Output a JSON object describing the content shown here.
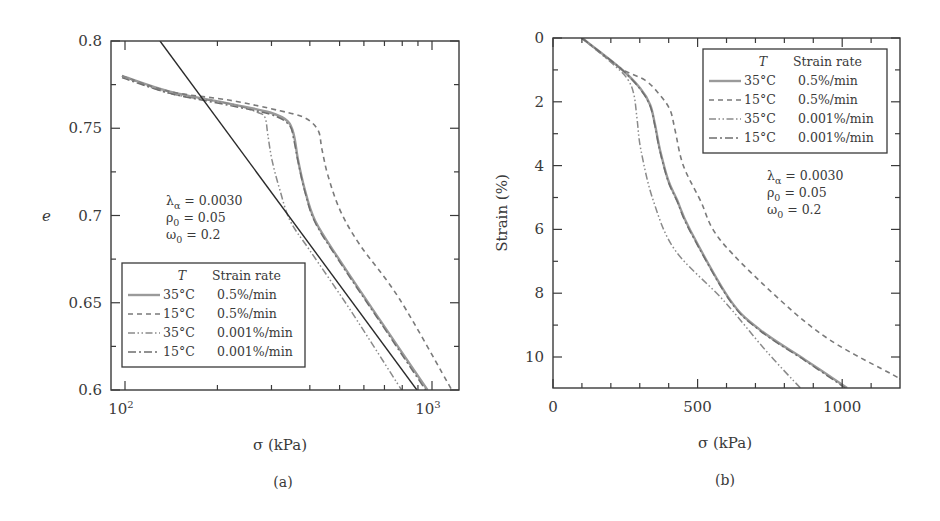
{
  "chart_data": [
    {
      "id": "a",
      "type": "line",
      "panel_label": "(a)",
      "title": "",
      "xlabel": "σ (kPa)",
      "ylabel": "e",
      "xscale": "log",
      "xlim": [
        90,
        1225
      ],
      "ylim": [
        0.6,
        0.8
      ],
      "xticks": [
        {
          "value": 100,
          "label": "10",
          "sup": "2"
        },
        {
          "value": 1000,
          "label": "10",
          "sup": "3"
        }
      ],
      "xminor": [
        200,
        300,
        400,
        500,
        600,
        700,
        800,
        900
      ],
      "yticks": [
        {
          "value": 0.8,
          "label": "0.8"
        },
        {
          "value": 0.75,
          "label": "0.75"
        },
        {
          "value": 0.7,
          "label": "0.7"
        },
        {
          "value": 0.65,
          "label": "0.65"
        },
        {
          "value": 0.6,
          "label": "0.6"
        }
      ],
      "yminor": [
        0.775,
        0.725,
        0.675,
        0.625
      ],
      "grid": false,
      "annotation": {
        "lines": [
          {
            "sym": "λ",
            "sub": "α",
            "rest": " = 0.0030"
          },
          {
            "sym": "ρ",
            "sub": "0",
            "rest": " = 0.05"
          },
          {
            "sym": "ω",
            "sub": "0",
            "rest": " = 0.2"
          }
        ]
      },
      "legend": {
        "position": "lower-left",
        "header_t": "T",
        "header_rate": "Strain rate",
        "entries": [
          {
            "temp": "35°C",
            "rate": "0.5%/min"
          },
          {
            "temp": "15°C",
            "rate": "0.5%/min"
          },
          {
            "temp": "35°C",
            "rate": "0.001%/min"
          },
          {
            "temp": "15°C",
            "rate": "0.001%/min"
          }
        ]
      },
      "series": [
        {
          "name": "35°C 0.5%/min",
          "style": "solid",
          "x": [
            97.8,
            140,
            220,
            297,
            339,
            355,
            366,
            385,
            416,
            502,
            677,
            967
          ],
          "y": [
            0.78,
            0.771,
            0.764,
            0.759,
            0.754,
            0.746,
            0.732,
            0.715,
            0.697,
            0.674,
            0.64,
            0.6
          ]
        },
        {
          "name": "15°C 0.5%/min",
          "style": "dashed",
          "x": [
            97.8,
            140,
            220,
            320,
            385,
            425,
            438,
            458,
            502,
            583,
            785,
            1160
          ],
          "y": [
            0.78,
            0.771,
            0.766,
            0.76,
            0.756,
            0.749,
            0.738,
            0.723,
            0.703,
            0.683,
            0.652,
            0.6
          ]
        },
        {
          "name": "35°C 0.001%/min",
          "style": "dash-dot-dot",
          "x": [
            97.8,
            140,
            220,
            271,
            286,
            292,
            301,
            319,
            345,
            400,
            541,
            796
          ],
          "y": [
            0.78,
            0.77,
            0.764,
            0.759,
            0.756,
            0.746,
            0.732,
            0.715,
            0.697,
            0.68,
            0.646,
            0.6
          ]
        },
        {
          "name": "15°C 0.001%/min",
          "style": "dash-dot",
          "x": [
            97.8,
            140,
            220,
            297,
            342,
            355,
            366,
            385,
            416,
            502,
            677,
            953
          ],
          "y": [
            0.779,
            0.77,
            0.763,
            0.758,
            0.752,
            0.743,
            0.731,
            0.714,
            0.696,
            0.673,
            0.639,
            0.6
          ]
        },
        {
          "name": "reference line",
          "style": "black-solid",
          "x": [
            130,
            893
          ],
          "y": [
            0.8,
            0.6
          ]
        }
      ]
    },
    {
      "id": "b",
      "type": "line",
      "panel_label": "(b)",
      "title": "",
      "xlabel": "σ (kPa)",
      "ylabel": "Strain (%)",
      "xscale": "linear",
      "xlim": [
        0,
        1200
      ],
      "ylim": [
        11,
        0
      ],
      "y_inverted": true,
      "xticks": [
        {
          "value": 0,
          "label": "0"
        },
        {
          "value": 500,
          "label": "500"
        },
        {
          "value": 1000,
          "label": "1000"
        }
      ],
      "xminor": [
        100,
        200,
        300,
        400,
        600,
        700,
        800,
        900,
        1100
      ],
      "yticks": [
        {
          "value": 0,
          "label": "0"
        },
        {
          "value": 2,
          "label": "2"
        },
        {
          "value": 4,
          "label": "4"
        },
        {
          "value": 6,
          "label": "6"
        },
        {
          "value": 8,
          "label": "8"
        },
        {
          "value": 10,
          "label": "10"
        }
      ],
      "yminor": [
        1,
        3,
        5,
        7,
        9
      ],
      "grid": false,
      "annotation": {
        "lines": [
          {
            "sym": "λ",
            "sub": "α",
            "rest": " = 0.0030"
          },
          {
            "sym": "ρ",
            "sub": "0",
            "rest": " = 0.05"
          },
          {
            "sym": "ω",
            "sub": "0",
            "rest": " = 0.2"
          }
        ]
      },
      "legend": {
        "position": "upper-right",
        "header_t": "T",
        "header_rate": "Strain rate",
        "entries": [
          {
            "temp": "35°C",
            "rate": "0.5%/min"
          },
          {
            "temp": "15°C",
            "rate": "0.5%/min"
          },
          {
            "temp": "35°C",
            "rate": "0.001%/min"
          },
          {
            "temp": "15°C",
            "rate": "0.001%/min"
          }
        ]
      },
      "series": [
        {
          "name": "35°C 0.5%/min",
          "style": "solid",
          "x": [
            100,
            232,
            301,
            336,
            353,
            370,
            398,
            429,
            474,
            612,
            716,
            872,
            1017
          ],
          "y": [
            0,
            0.94,
            1.57,
            2.1,
            2.73,
            3.51,
            4.45,
            5.08,
            6.02,
            8.21,
            9.15,
            10.09,
            10.97
          ]
        },
        {
          "name": "15°C 0.5%/min",
          "style": "dashed",
          "x": [
            100,
            232,
            318,
            370,
            405,
            422,
            450,
            509,
            578,
            785,
            958,
            1176,
            1201
          ],
          "y": [
            0,
            0.94,
            1.32,
            1.79,
            2.26,
            2.88,
            3.98,
            5.08,
            6.33,
            8.21,
            9.47,
            10.56,
            10.69
          ]
        },
        {
          "name": "35°C 0.001%/min",
          "style": "dash-dot-dot",
          "x": [
            100,
            215,
            260,
            280,
            291,
            304,
            346,
            422,
            588,
            734,
            855
          ],
          "y": [
            0,
            0.88,
            1.32,
            1.79,
            2.57,
            3.51,
            5.08,
            6.65,
            8.21,
            9.78,
            10.97
          ]
        },
        {
          "name": "15°C 0.001%/min",
          "style": "dash-dot",
          "x": [
            100,
            232,
            301,
            336,
            353,
            370,
            398,
            429,
            474,
            612,
            716,
            872,
            1010
          ],
          "y": [
            0,
            0.94,
            1.6,
            2.14,
            2.78,
            3.56,
            4.49,
            5.12,
            6.06,
            8.24,
            9.18,
            10.12,
            10.97
          ]
        }
      ]
    }
  ]
}
